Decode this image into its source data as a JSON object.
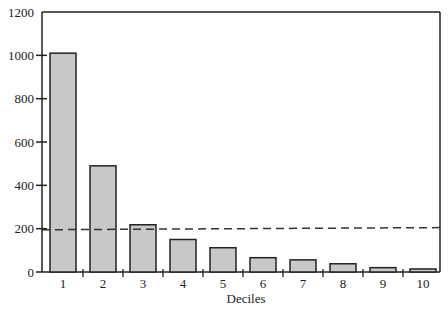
{
  "chart_data": {
    "type": "bar",
    "title": "",
    "xlabel": "Deciles",
    "ylabel": "",
    "categories": [
      "1",
      "2",
      "3",
      "4",
      "5",
      "6",
      "7",
      "8",
      "9",
      "10"
    ],
    "values": [
      1010,
      490,
      218,
      150,
      112,
      66,
      56,
      38,
      20,
      14
    ],
    "ylim": [
      0,
      1200
    ],
    "yticks": [
      0,
      200,
      400,
      600,
      800,
      1000,
      1200
    ],
    "grid": false,
    "legend": null,
    "reference_line": {
      "style": "dashed",
      "value_start": 195,
      "value_end": 205,
      "color": "#333333"
    },
    "bar_color": "#c8c8c8",
    "bar_edge_color": "#222222"
  }
}
